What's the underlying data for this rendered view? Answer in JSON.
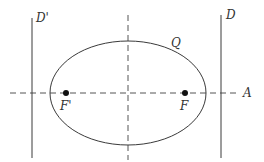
{
  "diagram": {
    "title": "",
    "colors": {
      "stroke": "#3a3a3a",
      "dash": "#555555",
      "point": "#111111",
      "text": "#333333"
    },
    "labels": {
      "directrix_left": "D'",
      "directrix_right": "D",
      "curve": "Q",
      "focus_left": "F'",
      "focus_right": "F",
      "axis": "A"
    },
    "elements": {
      "ellipse": {
        "cx": 128,
        "cy": 93,
        "rx": 78,
        "ry": 52
      },
      "major_axis": {
        "y": 93,
        "x1": 10,
        "x2": 238
      },
      "minor_axis": {
        "x": 128,
        "y1": 15,
        "y2": 160
      },
      "directrix_left": {
        "x": 32,
        "y1": 18,
        "y2": 158
      },
      "directrix_right": {
        "x": 221,
        "y1": 15,
        "y2": 158
      },
      "focus_left": {
        "x": 66,
        "y": 93
      },
      "focus_right": {
        "x": 185,
        "y": 93
      }
    }
  }
}
